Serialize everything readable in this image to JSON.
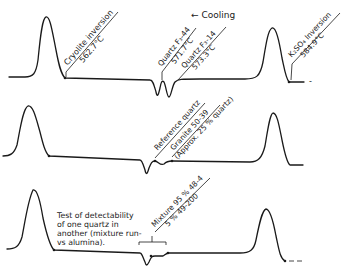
{
  "figure": {
    "direction_label": "← Cooling",
    "traces": [
      {
        "id": "trace-1",
        "annotations": [
          {
            "line1": "Cryolite inversion",
            "line2": "562.7°C"
          },
          {
            "line1": "Quartz F₃-44",
            "line2": "571.7°C"
          },
          {
            "line1": "Quartz F₃-14",
            "line2": "573.3°C"
          },
          {
            "line1": "K₂SO₄ Inversion",
            "line2": "584.9°C"
          }
        ]
      },
      {
        "id": "trace-2",
        "annotations": [
          {
            "line1": "Reference quartz"
          },
          {
            "line1": "Granite 50-39",
            "line2": "(Approx. 25 % quartz)"
          }
        ]
      },
      {
        "id": "trace-3",
        "annotations": [
          {
            "line1": "Mixture 95 % 48-4",
            "line2": "5 % 49-200"
          }
        ],
        "note": [
          "Test of detectability",
          "of one quartz in",
          "another (mixture run-",
          "vs alumina)."
        ]
      }
    ]
  }
}
